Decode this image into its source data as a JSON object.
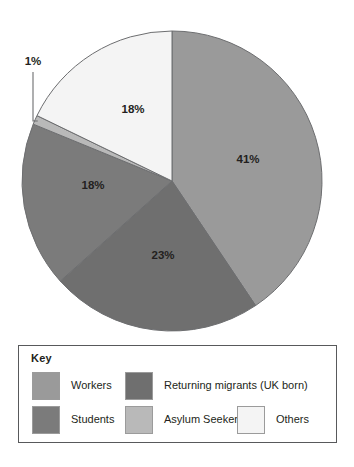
{
  "chart_data": {
    "type": "pie",
    "title": "",
    "start_angle_deg": 0,
    "direction": "clockwise",
    "categories": [
      "Workers",
      "Returning migrants (UK born)",
      "Students",
      "Asylum Seekers",
      "Others"
    ],
    "values": [
      41,
      23,
      18,
      1,
      18
    ],
    "value_suffix": "%",
    "labels": [
      "41%",
      "23%",
      "18%",
      "1%",
      "18%"
    ],
    "colors": [
      "#9a9a9a",
      "#6f6f6f",
      "#7b7b7b",
      "#b9b9b9",
      "#f4f4f4"
    ],
    "slice_stroke": "#6d6e70",
    "callout": {
      "category": "Asylum Seekers",
      "label": "1%"
    },
    "legend_position": "bottom",
    "grid": false
  },
  "pie": {
    "center_x": 172,
    "center_y": 181,
    "radius": 150,
    "slices": [
      {
        "name": "Workers",
        "label": "41%",
        "value": 41,
        "color": "#9a9a9a",
        "label_x": 248,
        "label_y": 160,
        "label_inside": true
      },
      {
        "name": "Returning migrants (UK born)",
        "label": "23%",
        "value": 23,
        "color": "#6f6f6f",
        "label_x": 163,
        "label_y": 256,
        "label_inside": true
      },
      {
        "name": "Students",
        "label": "18%",
        "value": 18,
        "color": "#7b7b7b",
        "label_x": 93,
        "label_y": 186,
        "label_inside": true
      },
      {
        "name": "Asylum Seekers",
        "label": "1%",
        "value": 1,
        "color": "#b9b9b9",
        "label_x": 33,
        "label_y": 62,
        "label_inside": false
      },
      {
        "name": "Others",
        "label": "18%",
        "value": 18,
        "color": "#f4f4f4",
        "label_x": 133,
        "label_y": 110,
        "label_inside": true
      }
    ]
  },
  "legend": {
    "title": "Key",
    "entries": [
      {
        "label": "Workers",
        "color": "#9a9a9a"
      },
      {
        "label": "Returning migrants (UK born)",
        "color": "#6f6f6f"
      },
      {
        "label": "Students",
        "color": "#7b7b7b"
      },
      {
        "label": "Asylum Seekers",
        "color": "#b9b9b9"
      },
      {
        "label": "Others",
        "color": "#f4f4f4"
      }
    ]
  },
  "bottom_caption": ""
}
